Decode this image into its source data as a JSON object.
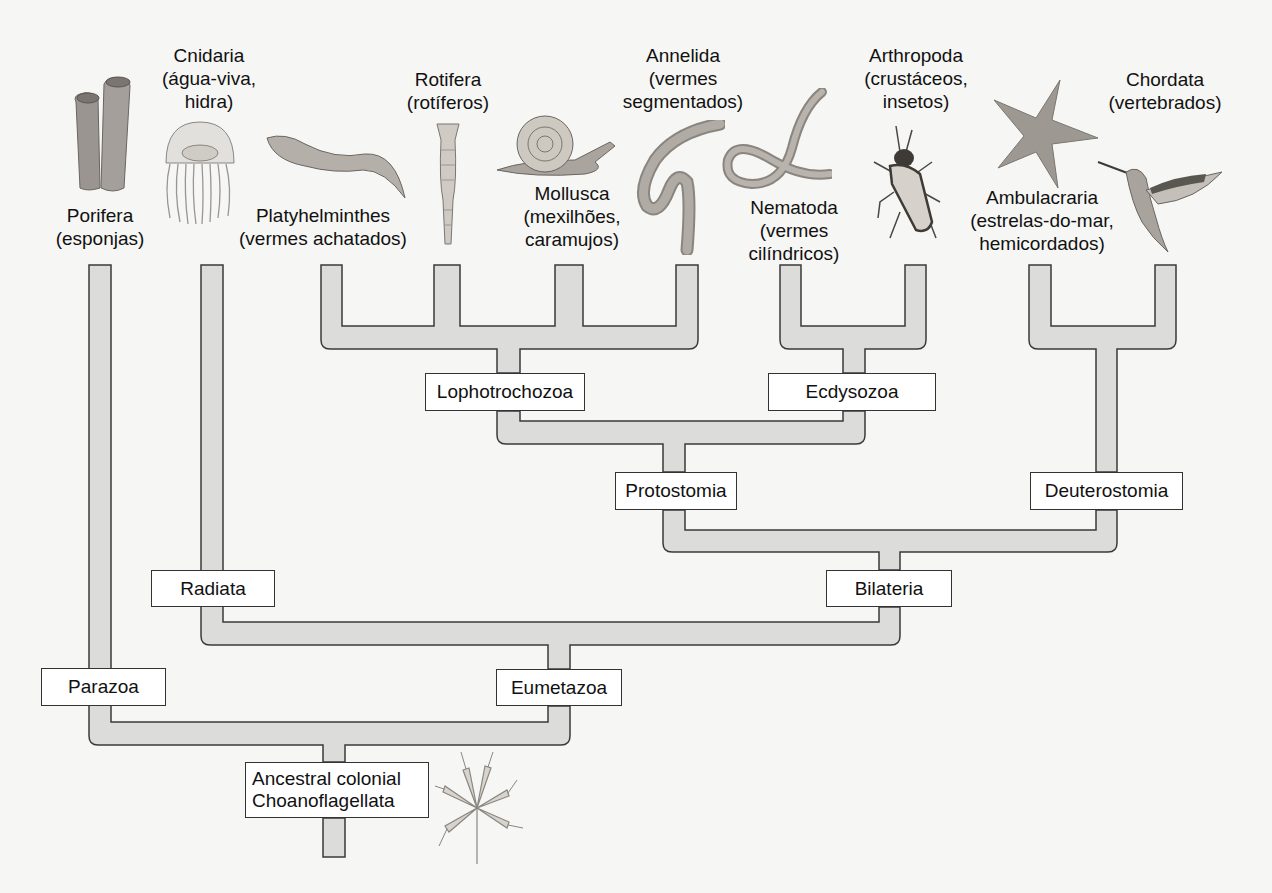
{
  "diagram": {
    "type": "phylogenetic-tree",
    "colors": {
      "background": "#f6f6f4",
      "branch_fill": "#dcdcda",
      "branch_stroke": "#3a3a3a",
      "node_box_fill": "#ffffff",
      "text": "#111111"
    }
  },
  "taxa": [
    {
      "name": "Porifera",
      "common": "(esponjas)",
      "organism": "sponge"
    },
    {
      "name": "Cnidaria",
      "common": "(água-viva, hidra)",
      "line1": "Cnidaria",
      "line2": "(água-viva,",
      "line3": "hidra)",
      "organism": "jellyfish"
    },
    {
      "name": "Platyhelminthes",
      "common": "(vermes achatados)",
      "organism": "flatworm"
    },
    {
      "name": "Rotifera",
      "common": "(rotíferos)",
      "organism": "rotifer"
    },
    {
      "name": "Mollusca",
      "common": "(mexilhões, caramujos)",
      "line1": "Mollusca",
      "line2": "(mexilhões,",
      "line3": "caramujos)",
      "organism": "snail"
    },
    {
      "name": "Annelida",
      "common": "(vermes segmentados)",
      "line1": "Annelida",
      "line2": "(vermes",
      "line3": "segmentados)",
      "organism": "earthworm"
    },
    {
      "name": "Nematoda",
      "common": "(vermes cilíndricos)",
      "line1": "Nematoda",
      "line2": "(vermes",
      "line3": "cilíndricos)",
      "organism": "roundworm"
    },
    {
      "name": "Arthropoda",
      "common": "(crustáceos, insetos)",
      "line1": "Arthropoda",
      "line2": "(crustáceos,",
      "line3": "insetos)",
      "organism": "insect"
    },
    {
      "name": "Ambulacraria",
      "common": "(estrelas-do-mar, hemicordados)",
      "line1": "Ambulacraria",
      "line2": "(estrelas-do-mar,",
      "line3": "hemicordados)",
      "organism": "starfish"
    },
    {
      "name": "Chordata",
      "common": "(vertebrados)",
      "organism": "hummingbird"
    }
  ],
  "clades": {
    "lophotrochozoa": "Lophotrochozoa",
    "ecdysozoa": "Ecdysozoa",
    "protostomia": "Protostomia",
    "deuterostomia": "Deuterostomia",
    "bilateria": "Bilateria",
    "radiata": "Radiata",
    "eumetazoa": "Eumetazoa",
    "parazoa": "Parazoa",
    "ancestor_line1": "Ancestral colonial",
    "ancestor_line2": "Choanoflagellata"
  }
}
